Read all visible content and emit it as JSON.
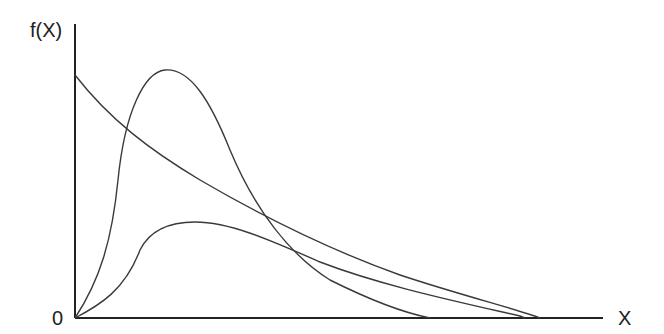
{
  "diagram": {
    "y_axis_label": "f(X)",
    "x_axis_label": "X",
    "origin_label": "0",
    "curves": [
      {
        "name": "exponential-decay",
        "description": "starts high at y-axis and decays toward x-axis"
      },
      {
        "name": "tall-peaked",
        "description": "rises steeply from origin to a tall peak then falls"
      },
      {
        "name": "low-peaked",
        "description": "rises from origin to a low broad peak then long tail"
      }
    ],
    "colors": {
      "line": "#3a3a3a",
      "axis": "#222222",
      "background": "#ffffff"
    }
  }
}
